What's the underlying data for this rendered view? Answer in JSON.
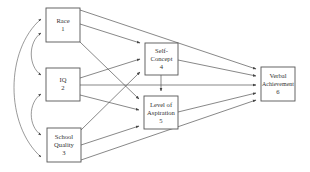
{
  "diagram": {
    "type": "path-diagram",
    "nodes": [
      {
        "id": 1,
        "label_lines": [
          "Race",
          "1"
        ],
        "name": "Race",
        "x": 46,
        "y": 8,
        "w": 34,
        "h": 34
      },
      {
        "id": 2,
        "label_lines": [
          "IQ",
          "2"
        ],
        "name": "IQ",
        "x": 46,
        "y": 68,
        "w": 34,
        "h": 33
      },
      {
        "id": 3,
        "label_lines": [
          "School",
          "Quality",
          "3"
        ],
        "name": "School Quality",
        "x": 47,
        "y": 128,
        "w": 34,
        "h": 34
      },
      {
        "id": 4,
        "label_lines": [
          "Self-",
          "Concept",
          "4"
        ],
        "name": "Self-Concept",
        "x": 145,
        "y": 43,
        "w": 33,
        "h": 32
      },
      {
        "id": 5,
        "label_lines": [
          "Level of",
          "Aspiration",
          "5"
        ],
        "name": "Level of Aspiration",
        "x": 144,
        "y": 96,
        "w": 34,
        "h": 33
      },
      {
        "id": 6,
        "label_lines": [
          "Verbal",
          "Achievement",
          "6"
        ],
        "name": "Verbal Achievement",
        "x": 261,
        "y": 67,
        "w": 34,
        "h": 34
      }
    ],
    "directed_edges": [
      {
        "from": 1,
        "to": 6
      },
      {
        "from": 1,
        "to": 4
      },
      {
        "from": 1,
        "to": 5
      },
      {
        "from": 2,
        "to": 4
      },
      {
        "from": 2,
        "to": 5
      },
      {
        "from": 2,
        "to": 6
      },
      {
        "from": 3,
        "to": 4
      },
      {
        "from": 3,
        "to": 5
      },
      {
        "from": 3,
        "to": 6
      },
      {
        "from": 4,
        "to": 5
      },
      {
        "from": 4,
        "to": 6
      },
      {
        "from": 5,
        "to": 6
      }
    ],
    "correlations": [
      {
        "between": [
          1,
          2
        ]
      },
      {
        "between": [
          2,
          3
        ]
      },
      {
        "between": [
          1,
          3
        ]
      }
    ]
  }
}
